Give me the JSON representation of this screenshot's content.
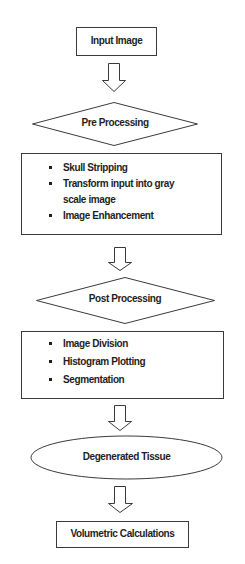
{
  "flowchart": {
    "input": {
      "label": "Input Image",
      "shape": "rectangle"
    },
    "pre_processing": {
      "label": "Pre Processing",
      "shape": "diamond"
    },
    "pre_steps": {
      "shape": "rectangle",
      "items": [
        {
          "label": "Skull Stripping"
        },
        {
          "label": "Transform input into gray scale image"
        },
        {
          "label": "Image Enhancement"
        }
      ]
    },
    "post_processing": {
      "label": "Post Processing",
      "shape": "diamond"
    },
    "post_steps": {
      "shape": "rectangle",
      "items": [
        {
          "label": "Image Division"
        },
        {
          "label": "Histogram Plotting"
        },
        {
          "label": "Segmentation"
        }
      ]
    },
    "degenerated": {
      "label": "Degenerated Tissue",
      "shape": "ellipse"
    },
    "output": {
      "label": "Volumetric Calculations",
      "shape": "rectangle"
    },
    "arrow_icon": "hollow-down-arrow",
    "colors": {
      "stroke": "#3a3a3a",
      "text": "#1e1e1e",
      "background": "#ffffff"
    }
  }
}
